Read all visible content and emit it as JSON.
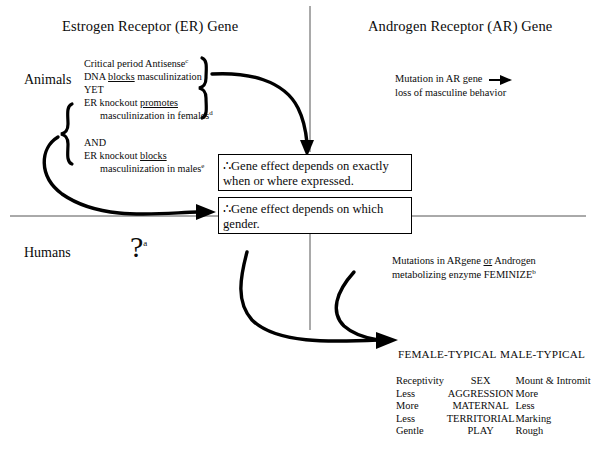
{
  "headings": {
    "left": "Estrogen Receptor (ER) Gene",
    "right": "Androgen Receptor (AR) Gene"
  },
  "row_labels": {
    "animals": "Animals",
    "humans": "Humans"
  },
  "animals_er": {
    "line1": "Critical period Antisense",
    "line1_sup": "c",
    "line2_a": "DNA ",
    "line2_b": "blocks",
    "line2_c": " masculinization",
    "line3": "YET",
    "line4_a": "ER knockout ",
    "line4_b": "promotes",
    "line5": "masculinization in females",
    "line5_sup": "d",
    "line6": "AND",
    "line7_a": "ER knockout ",
    "line7_b": "blocks",
    "line8": "masculinization in males",
    "line8_sup": "e"
  },
  "animals_ar": {
    "line1": "Mutation in AR gene",
    "arrow": "arrow-right",
    "line2": "loss of masculine behavior"
  },
  "conclusion_boxes": [
    {
      "symbol": "∴",
      "text": "Gene effect depends on exactly when or where expressed."
    },
    {
      "symbol": "∴",
      "text": "Gene effect depends on which gender."
    }
  ],
  "humans": {
    "question": "?",
    "question_sup": "a",
    "ar_note_line1_a": "Mutations in ARgene ",
    "ar_note_line1_b": "or",
    "ar_note_line1_c": " Androgen",
    "ar_note_line2": "metabolizing enzyme FEMINIZE",
    "ar_note_sup": "b"
  },
  "outcome_table": {
    "headers": [
      "FEMALE-TYPICAL",
      "MALE-TYPICAL"
    ],
    "rows": [
      {
        "female": "Receptivity",
        "category": "SEX",
        "male": "Mount & Intromit"
      },
      {
        "female": "Less",
        "category": "AGGRESSION",
        "male": "More"
      },
      {
        "female": "More",
        "category": "MATERNAL",
        "male": "Less"
      },
      {
        "female": "Less",
        "category": "TERRITORIAL",
        "male": "Marking"
      },
      {
        "female": "Gentle",
        "category": "PLAY",
        "male": "Rough"
      }
    ]
  },
  "colors": {
    "ink": "#0b0b0b",
    "rule": "#555555",
    "background": "#ffffff"
  }
}
